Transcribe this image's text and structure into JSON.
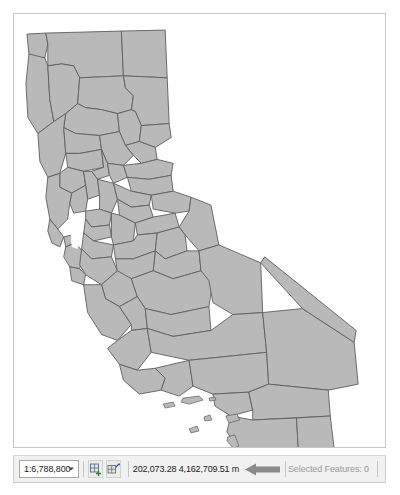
{
  "window": {
    "title": "Map View"
  },
  "map": {
    "name": "california-counties-map",
    "fill_color": "#b9b9b9",
    "stroke_color": "#5e5e5e",
    "background_color": "#ffffff",
    "frame_border_color": "#c8c8c8"
  },
  "status_bar": {
    "scale": {
      "value": "1:6,788,800",
      "placeholder": "1:6,788,800"
    },
    "tools": [
      {
        "icon": "add-grid-icon",
        "label": ""
      },
      {
        "icon": "measure-grid-icon",
        "label": ""
      }
    ],
    "coordinates": {
      "text": "202,073.28 4,162,709.51 m",
      "x": "202,073.28",
      "y": "4,162,709.51",
      "units": "m"
    },
    "annotation": {
      "icon": "left-arrow-icon",
      "color": "#8a8a8a"
    },
    "selected_features": {
      "label": "Selected Features: 0",
      "count": "0",
      "color": "#9a9a9a"
    }
  }
}
